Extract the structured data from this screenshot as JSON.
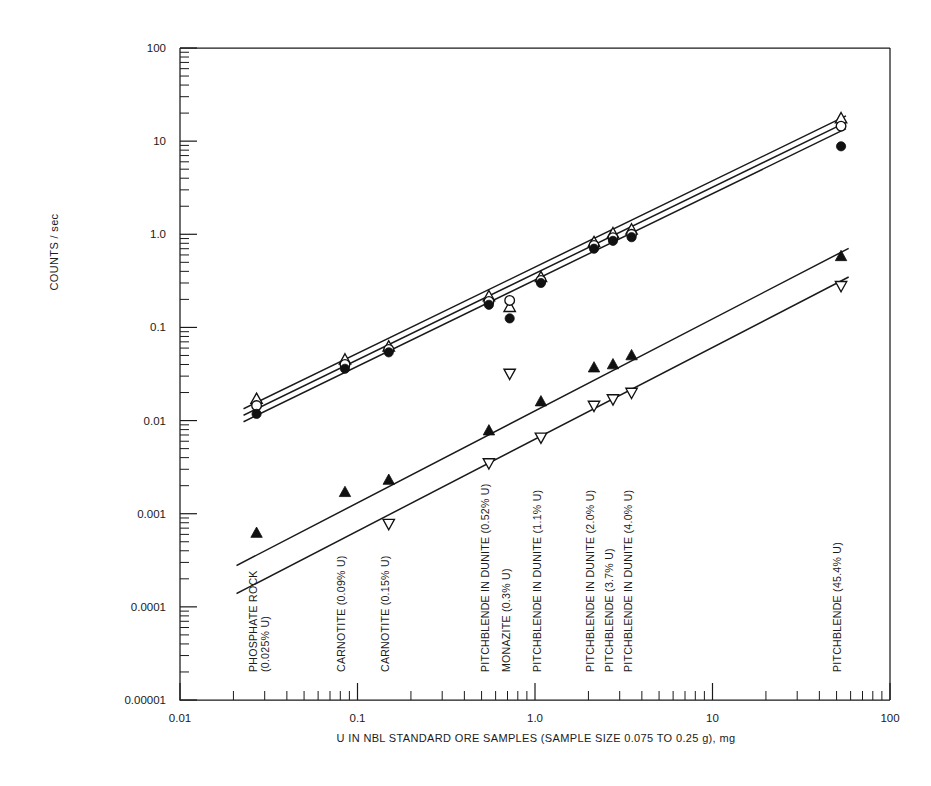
{
  "chart_data": {
    "type": "scatter",
    "title": "",
    "xlabel": "U IN NBL STANDARD ORE SAMPLES (SAMPLE SIZE 0.075 TO 0.25 g), mg",
    "ylabel": "COUNTS / sec",
    "xscale": "log",
    "yscale": "log",
    "xlim": [
      0.01,
      100
    ],
    "ylim": [
      1e-05,
      100
    ],
    "grid": false,
    "legend": "none",
    "xticklabels": [
      "0.01",
      "0.1",
      "1.0",
      "10",
      "100"
    ],
    "xtickvalues": [
      0.01,
      0.1,
      1.0,
      10,
      100
    ],
    "yticklabels": [
      "100",
      "10",
      "1.0",
      "0.1",
      "0.01",
      "0.001",
      "0.0001",
      "0.00001"
    ],
    "ytickvalues": [
      100,
      10,
      1.0,
      0.1,
      0.01,
      0.001,
      0.0001,
      1e-05
    ],
    "sample_labels": [
      {
        "text": "PHOSPHATE ROCK",
        "text2": "(0.025% U)",
        "x": 0.027
      },
      {
        "text": "CARNOTITE (0.09% U)",
        "text2": "",
        "x": 0.085
      },
      {
        "text": "CARNOTITE (0.15% U)",
        "text2": "",
        "x": 0.15
      },
      {
        "text": "PITCHBLENDE IN DUNITE (0.52% U)",
        "text2": "",
        "x": 0.55
      },
      {
        "text": "MONAZITE (0.3% U)",
        "text2": "",
        "x": 0.72
      },
      {
        "text": "PITCHBLENDE IN DUNITE (1.1% U)",
        "text2": "",
        "x": 1.08
      },
      {
        "text": "PITCHBLENDE IN DUNITE (2.0% U)",
        "text2": "",
        "x": 2.15
      },
      {
        "text": "PITCHBLENDE (3.7% U)",
        "text2": "",
        "x": 2.75
      },
      {
        "text": "PITCHBLENDE IN DUNITE (4.0% U)",
        "text2": "",
        "x": 3.5
      },
      {
        "text": "PITCHBLENDE (45.4% U)",
        "text2": "",
        "x": 53
      }
    ],
    "series": [
      {
        "name": "open-triangle-up",
        "marker": "triangle-up-open",
        "points": [
          {
            "x": 0.027,
            "y": 0.017
          },
          {
            "x": 0.085,
            "y": 0.045
          },
          {
            "x": 0.15,
            "y": 0.062
          },
          {
            "x": 0.55,
            "y": 0.215
          },
          {
            "x": 0.72,
            "y": 0.165
          },
          {
            "x": 1.08,
            "y": 0.345
          },
          {
            "x": 2.15,
            "y": 0.82
          },
          {
            "x": 2.75,
            "y": 1.02
          },
          {
            "x": 3.5,
            "y": 1.12
          },
          {
            "x": 53,
            "y": 17.5
          }
        ]
      },
      {
        "name": "open-circle",
        "marker": "circle-open",
        "points": [
          {
            "x": 0.027,
            "y": 0.0145
          },
          {
            "x": 0.085,
            "y": 0.04
          },
          {
            "x": 0.15,
            "y": 0.058
          },
          {
            "x": 0.55,
            "y": 0.19
          },
          {
            "x": 0.72,
            "y": 0.195
          },
          {
            "x": 1.08,
            "y": 0.32
          },
          {
            "x": 2.15,
            "y": 0.76
          },
          {
            "x": 2.75,
            "y": 0.92
          },
          {
            "x": 3.5,
            "y": 1.0
          },
          {
            "x": 53,
            "y": 14.5
          }
        ]
      },
      {
        "name": "filled-circle",
        "marker": "circle-filled",
        "points": [
          {
            "x": 0.027,
            "y": 0.0118
          },
          {
            "x": 0.085,
            "y": 0.036
          },
          {
            "x": 0.15,
            "y": 0.054
          },
          {
            "x": 0.55,
            "y": 0.175
          },
          {
            "x": 0.72,
            "y": 0.125
          },
          {
            "x": 1.08,
            "y": 0.3
          },
          {
            "x": 2.15,
            "y": 0.7
          },
          {
            "x": 2.75,
            "y": 0.85
          },
          {
            "x": 3.5,
            "y": 0.93
          },
          {
            "x": 53,
            "y": 8.8
          }
        ]
      },
      {
        "name": "filled-triangle-up",
        "marker": "triangle-up-filled",
        "points": [
          {
            "x": 0.027,
            "y": 0.00062
          },
          {
            "x": 0.085,
            "y": 0.0017
          },
          {
            "x": 0.15,
            "y": 0.0023
          },
          {
            "x": 0.55,
            "y": 0.0078
          },
          {
            "x": 1.08,
            "y": 0.016
          },
          {
            "x": 2.15,
            "y": 0.037
          },
          {
            "x": 2.75,
            "y": 0.04
          },
          {
            "x": 3.5,
            "y": 0.05
          },
          {
            "x": 53,
            "y": 0.58
          }
        ]
      },
      {
        "name": "open-triangle-down",
        "marker": "triangle-down-open",
        "points": [
          {
            "x": 0.15,
            "y": 0.00078
          },
          {
            "x": 0.55,
            "y": 0.0035
          },
          {
            "x": 0.72,
            "y": 0.032
          },
          {
            "x": 1.08,
            "y": 0.0066
          },
          {
            "x": 2.15,
            "y": 0.0145
          },
          {
            "x": 2.75,
            "y": 0.017
          },
          {
            "x": 3.5,
            "y": 0.02
          },
          {
            "x": 53,
            "y": 0.28
          }
        ]
      }
    ],
    "trendlines": [
      {
        "name": "upper-band-line-1",
        "x1": 0.023,
        "y1": 0.0135,
        "x2": 56,
        "y2": 18.5
      },
      {
        "name": "upper-band-line-2",
        "x1": 0.023,
        "y1": 0.0115,
        "x2": 56,
        "y2": 15.8
      },
      {
        "name": "upper-band-line-3",
        "x1": 0.023,
        "y1": 0.0098,
        "x2": 56,
        "y2": 13.5
      },
      {
        "name": "lower-line-filled-triangle",
        "x1": 0.021,
        "y1": 0.00028,
        "x2": 58,
        "y2": 0.7
      },
      {
        "name": "lower-line-open-triangle",
        "x1": 0.021,
        "y1": 0.00014,
        "x2": 58,
        "y2": 0.345
      }
    ]
  }
}
